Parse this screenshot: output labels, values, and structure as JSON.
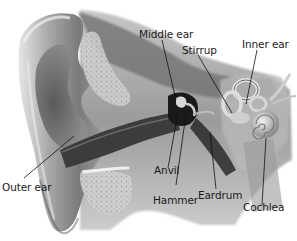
{
  "diagram": {
    "style": "grayscale illustration",
    "labels": [
      {
        "id": "middle-ear",
        "text": "Middle ear"
      },
      {
        "id": "stirrup",
        "text": "Stirrup"
      },
      {
        "id": "inner-ear",
        "text": "Inner ear"
      },
      {
        "id": "outer-ear",
        "text": "Outer ear"
      },
      {
        "id": "anvil",
        "text": "Anvil"
      },
      {
        "id": "hammer",
        "text": "Hammer"
      },
      {
        "id": "eardrum",
        "text": "Eardrum"
      },
      {
        "id": "cochlea",
        "text": "Cochlea"
      }
    ]
  },
  "colors": {
    "background": "#ffffff",
    "label_text": "#1a1a1a",
    "leader_line": "#111111",
    "skin_light": "#d9d9d9",
    "skin_mid": "#9a9a9a",
    "skin_dark": "#3a3a3a",
    "bone": "#c8c8c8",
    "canal_dark": "#1e1e1e"
  }
}
